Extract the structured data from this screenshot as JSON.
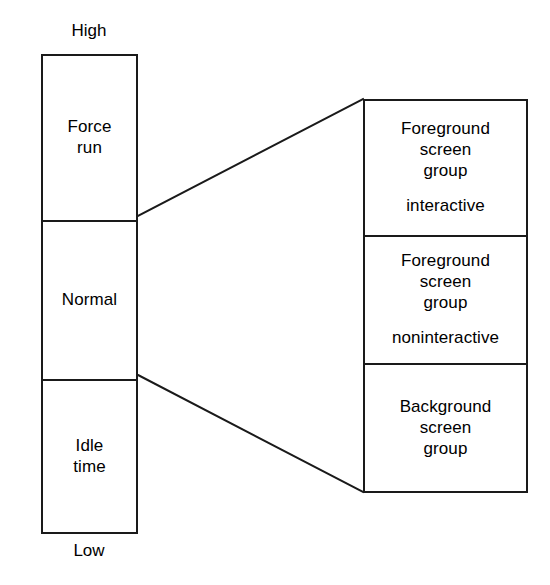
{
  "diagram": {
    "axis": {
      "top_label": "High",
      "bottom_label": "Low"
    },
    "priority_column": {
      "cells": [
        {
          "name": "force-run",
          "lines": [
            "Force",
            "run"
          ]
        },
        {
          "name": "normal",
          "lines": [
            "Normal"
          ]
        },
        {
          "name": "idle-time",
          "lines": [
            "Idle",
            "time"
          ]
        }
      ]
    },
    "screen_group_column": {
      "cells": [
        {
          "name": "foreground-interactive",
          "lines": [
            "Foreground",
            "screen",
            "group"
          ],
          "qualifier": "interactive"
        },
        {
          "name": "foreground-noninteractive",
          "lines": [
            "Foreground",
            "screen",
            "group"
          ],
          "qualifier": "noninteractive"
        },
        {
          "name": "background",
          "lines": [
            "Background",
            "screen",
            "group"
          ],
          "qualifier": ""
        }
      ]
    },
    "connectors": [
      {
        "name": "force-run-to-foreground-interactive",
        "x1": 138,
        "y1": 216,
        "x2": 363,
        "y2": 99
      },
      {
        "name": "idle-time-to-background",
        "x1": 138,
        "y1": 375,
        "x2": 363,
        "y2": 492
      }
    ],
    "colors": {
      "stroke": "#1a1a1a",
      "background": "#ffffff",
      "text": "#000000"
    }
  }
}
